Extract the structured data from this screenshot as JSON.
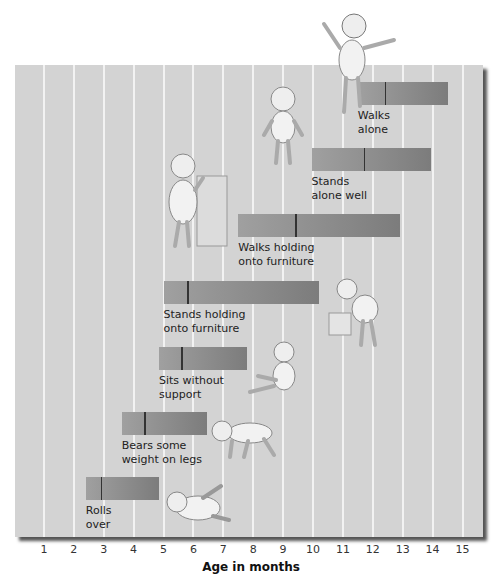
{
  "chart_data": {
    "type": "bar",
    "subtype": "range-bar (Denver milestone norms)",
    "title": "",
    "xlabel": "Age in months",
    "ylabel": "",
    "xlim": [
      0,
      15.6
    ],
    "x_ticks": [
      1,
      2,
      3,
      4,
      5,
      6,
      7,
      8,
      9,
      10,
      11,
      12,
      13,
      14,
      15
    ],
    "grid": true,
    "series": [
      {
        "name": "Rolls over",
        "start": 2.4,
        "median": 2.9,
        "end": 4.85
      },
      {
        "name": "Bears some weight on legs",
        "start": 3.6,
        "median": 4.35,
        "end": 6.45
      },
      {
        "name": "Sits without support",
        "start": 4.85,
        "median": 5.6,
        "end": 7.8
      },
      {
        "name": "Stands holding onto furniture",
        "start": 5.0,
        "median": 5.8,
        "end": 10.2
      },
      {
        "name": "Walks holding onto furniture",
        "start": 7.5,
        "median": 9.4,
        "end": 12.9
      },
      {
        "name": "Stands alone well",
        "start": 9.95,
        "median": 11.7,
        "end": 13.95
      },
      {
        "name": "Walks alone",
        "start": 11.5,
        "median": 12.4,
        "end": 14.5
      }
    ]
  },
  "bars": [
    {
      "label": "Rolls\nover",
      "top": 477
    },
    {
      "label": "Bears some\nweight on legs",
      "top": 412
    },
    {
      "label": "Sits without\nsupport",
      "top": 347
    },
    {
      "label": "Stands holding\nonto furniture",
      "top": 281
    },
    {
      "label": "Walks holding\nonto furniture",
      "top": 214
    },
    {
      "label": "Stands\nalone well",
      "top": 148
    },
    {
      "label": "Walks\nalone",
      "top": 82
    }
  ],
  "axis": {
    "label": "Age in months"
  },
  "colors": {
    "panel": "#d3d3d3",
    "grid": "#f2f2f2",
    "bar_light": "#a0a0a0",
    "bar_dark": "#7c7c7c",
    "median": "#333333"
  }
}
